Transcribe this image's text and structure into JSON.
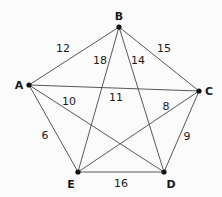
{
  "chart_data": {
    "type": "diagram",
    "diagram_kind": "weighted-undirected-graph",
    "title": "",
    "background_color": "#fbfbfb",
    "edge_color": "#585858",
    "node_color": "#111111",
    "label_color": "#1a1a1a",
    "nodes": [
      {
        "id": "A",
        "label": "A",
        "x": 29,
        "y": 85,
        "label_x": 19,
        "label_y": 85
      },
      {
        "id": "B",
        "label": "B",
        "x": 119,
        "y": 27,
        "label_x": 119,
        "label_y": 16
      },
      {
        "id": "C",
        "label": "C",
        "x": 199,
        "y": 91,
        "label_x": 209,
        "label_y": 91
      },
      {
        "id": "D",
        "label": "D",
        "x": 164,
        "y": 172,
        "label_x": 171,
        "label_y": 184
      },
      {
        "id": "E",
        "label": "E",
        "x": 78,
        "y": 172,
        "label_x": 71,
        "label_y": 184
      }
    ],
    "edges": [
      {
        "from": "A",
        "to": "B",
        "weight": 12,
        "label": "12",
        "label_x": 63,
        "label_y": 48
      },
      {
        "from": "B",
        "to": "C",
        "weight": 15,
        "label": "15",
        "label_x": 164,
        "label_y": 48
      },
      {
        "from": "B",
        "to": "E",
        "weight": 18,
        "label": "18",
        "label_x": 100,
        "label_y": 60
      },
      {
        "from": "B",
        "to": "D",
        "weight": 14,
        "label": "14",
        "label_x": 138,
        "label_y": 60
      },
      {
        "from": "A",
        "to": "C",
        "weight": 11,
        "label": "11",
        "label_x": 116,
        "label_y": 97
      },
      {
        "from": "A",
        "to": "D",
        "weight": 10,
        "label": "10",
        "label_x": 69,
        "label_y": 101
      },
      {
        "from": "A",
        "to": "E",
        "weight": 6,
        "label": "6",
        "label_x": 45,
        "label_y": 135
      },
      {
        "from": "C",
        "to": "E",
        "weight": 8,
        "label": "8",
        "label_x": 166,
        "label_y": 106
      },
      {
        "from": "C",
        "to": "D",
        "weight": 9,
        "label": "9",
        "label_x": 187,
        "label_y": 136
      },
      {
        "from": "E",
        "to": "D",
        "weight": 16,
        "label": "16",
        "label_x": 121,
        "label_y": 183
      }
    ],
    "node_count": 5,
    "edge_count": 10
  }
}
